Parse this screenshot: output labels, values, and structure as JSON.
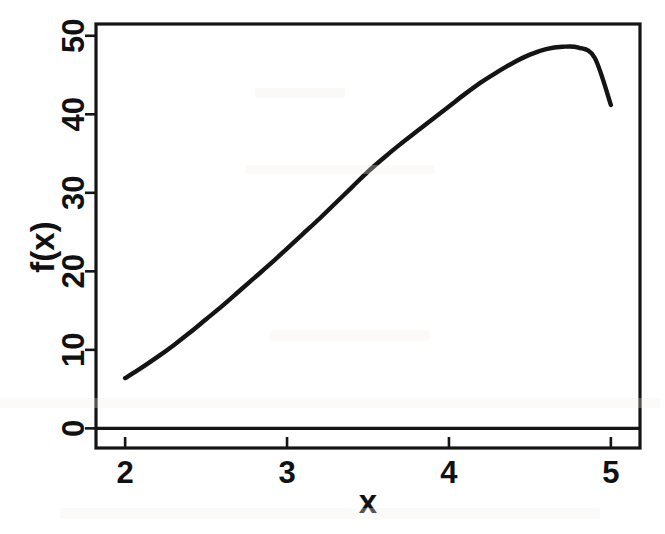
{
  "figure": {
    "name": "function-plot",
    "background_color": "#ffffff",
    "ink_color": "#141414"
  },
  "chart_data": {
    "type": "line",
    "title": "",
    "subtitle": "",
    "xlabel": "x",
    "ylabel": "f(x)",
    "xlim": [
      1.82,
      5.18
    ],
    "ylim": [
      -2.5,
      51.5
    ],
    "xticks": [
      2,
      3,
      4,
      5
    ],
    "xtick_labels": [
      "2",
      "3",
      "4",
      "5"
    ],
    "yticks": [
      0,
      10,
      20,
      30,
      40,
      50
    ],
    "ytick_labels": [
      "0",
      "10",
      "20",
      "30",
      "40",
      "50"
    ],
    "grid": false,
    "legend": null,
    "legend_position": "none",
    "frame": "box",
    "annotations": [],
    "reference_lines": [
      {
        "name": "zero-baseline",
        "axis": "y",
        "value": 0
      }
    ],
    "series": [
      {
        "name": "f(x)",
        "color": "#141414",
        "line_width": 4.4,
        "marker": "none",
        "x": [
          2.0,
          2.1,
          2.2,
          2.3,
          2.4,
          2.5,
          2.6,
          2.7,
          2.8,
          2.9,
          3.0,
          3.1,
          3.2,
          3.3,
          3.4,
          3.5,
          3.6,
          3.7,
          3.8,
          3.9,
          4.0,
          4.1,
          4.2,
          4.3,
          4.4,
          4.5,
          4.6,
          4.7,
          4.8,
          4.9,
          5.0
        ],
        "y": [
          6.4,
          7.7,
          9.1,
          10.6,
          12.2,
          13.9,
          15.6,
          17.4,
          19.2,
          21.0,
          22.9,
          24.8,
          26.7,
          28.7,
          30.7,
          32.7,
          34.5,
          36.2,
          37.8,
          39.4,
          41.0,
          42.6,
          44.1,
          45.4,
          46.6,
          47.6,
          48.3,
          48.6,
          48.5,
          47.2,
          41.2
        ],
        "notable_points": {
          "start": {
            "x": 2.0,
            "y": 6.4
          },
          "peak": {
            "x": 4.75,
            "y": 48.6
          },
          "end": {
            "x": 5.0,
            "y": 41.2
          }
        }
      }
    ]
  }
}
